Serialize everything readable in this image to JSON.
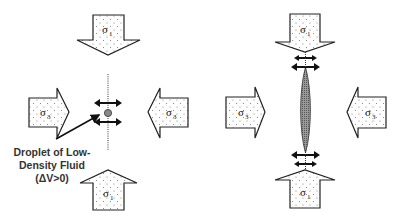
{
  "diagram": {
    "panels": [
      {
        "id": "droplet",
        "arrows": [
          {
            "position": "top",
            "direction": "down",
            "symbol": "σ",
            "subscript": "1"
          },
          {
            "position": "bottom",
            "direction": "up",
            "symbol": "σ",
            "subscript": "1"
          },
          {
            "position": "left",
            "direction": "right",
            "symbol": "σ",
            "subscript": "3"
          },
          {
            "position": "right",
            "direction": "left",
            "symbol": "σ",
            "subscript": "3"
          }
        ],
        "center_feature": "droplet",
        "annotation": {
          "lines": [
            "Droplet of Low-",
            "Density Fluid",
            "(ΔV>0)"
          ]
        }
      },
      {
        "id": "crack",
        "arrows": [
          {
            "position": "top",
            "direction": "down",
            "symbol": "σ",
            "subscript": "1"
          },
          {
            "position": "bottom",
            "direction": "up",
            "symbol": "σ",
            "subscript": "1"
          },
          {
            "position": "left",
            "direction": "right",
            "symbol": "σ",
            "subscript": "3"
          },
          {
            "position": "right",
            "direction": "left",
            "symbol": "σ",
            "subscript": "3"
          }
        ],
        "center_feature": "elongated-crack"
      }
    ],
    "colors": {
      "outline": "#222222",
      "fill": "#ffffff",
      "stipple": "#777777",
      "droplet": "#888888",
      "lens": "#7a7a7a"
    }
  }
}
